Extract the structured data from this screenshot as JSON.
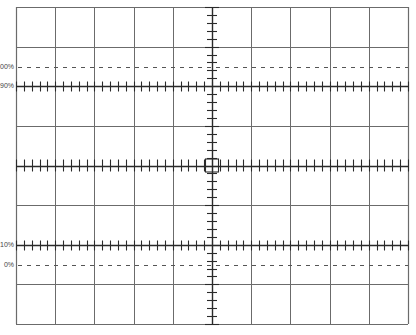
{
  "diagram": {
    "type": "oscilloscope-graticule",
    "grid": {
      "left": 16,
      "top": 7,
      "right": 408,
      "bottom": 324,
      "cols": 10,
      "rows": 8,
      "minor_ticks_per_division": 5,
      "line_color": "#6b6b6b",
      "axis_color": "#2a2a2a"
    },
    "reference_lines": [
      {
        "label": "100%",
        "y": 67,
        "style": "dashed"
      },
      {
        "label": "90%",
        "y": 86,
        "style": "solid-ticked"
      },
      {
        "label": "10%",
        "y": 245,
        "style": "solid-ticked"
      },
      {
        "label": "0%",
        "y": 265,
        "style": "dashed"
      }
    ]
  },
  "labels": {
    "p100": "100%",
    "p90": "90%",
    "p10": "10%",
    "p0": "0%"
  }
}
